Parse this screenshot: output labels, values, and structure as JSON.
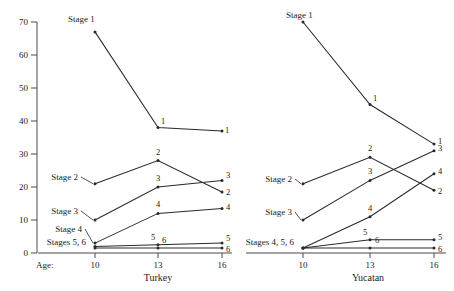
{
  "figure": {
    "axis": {
      "y_ticks": [
        0,
        10,
        20,
        30,
        40,
        50,
        60,
        70
      ],
      "y_min": 0,
      "y_max": 70,
      "x_ticks": [
        10,
        13,
        16
      ],
      "age_prefix_label": "Age:"
    },
    "panels": [
      {
        "title": "Turkey",
        "stage_labels": [
          "Stage 1",
          "Stage 2",
          "Stage 3",
          "Stage 4",
          "Stages 5, 6"
        ],
        "point_labels": [
          "1",
          "2",
          "3",
          "4",
          "5",
          "6"
        ]
      },
      {
        "title": "Yucatan",
        "stage_labels": [
          "Stage 1",
          "Stage 2",
          "Stage 3",
          "Stages 4, 5, 6"
        ],
        "point_labels": [
          "1",
          "2",
          "3",
          "4",
          "5",
          "6"
        ]
      }
    ]
  },
  "chart_data": {
    "type": "line",
    "title": "",
    "xlabel": "Age:",
    "ylabel": "",
    "x": [
      10,
      13,
      16
    ],
    "xlim": [
      10,
      16
    ],
    "ylim": [
      0,
      70
    ],
    "grid": false,
    "legend": "inline-labels",
    "panels": [
      {
        "name": "Turkey",
        "series": [
          {
            "name": "Stage 1",
            "label": "1",
            "values": [
              67,
              38,
              37
            ]
          },
          {
            "name": "Stage 2",
            "label": "2",
            "values": [
              21,
              28,
              18.5
            ]
          },
          {
            "name": "Stage 3",
            "label": "3",
            "values": [
              10,
              20,
              22
            ]
          },
          {
            "name": "Stage 4",
            "label": "4",
            "values": [
              3,
              12,
              13.5
            ]
          },
          {
            "name": "Stage 5",
            "label": "5",
            "values": [
              2,
              2.5,
              3
            ]
          },
          {
            "name": "Stage 6",
            "label": "6",
            "values": [
              1.5,
              1.5,
              1.5
            ]
          }
        ]
      },
      {
        "name": "Yucatan",
        "series": [
          {
            "name": "Stage 1",
            "label": "1",
            "values": [
              70,
              45,
              33
            ]
          },
          {
            "name": "Stage 2",
            "label": "2",
            "values": [
              21,
              29,
              19
            ]
          },
          {
            "name": "Stage 3",
            "label": "3",
            "values": [
              10,
              22,
              31
            ]
          },
          {
            "name": "Stage 4",
            "label": "4",
            "values": [
              1.5,
              11,
              24
            ]
          },
          {
            "name": "Stage 5",
            "label": "5",
            "values": [
              1.5,
              4,
              4
            ]
          },
          {
            "name": "Stage 6",
            "label": "6",
            "values": [
              1.5,
              1.5,
              1.5
            ]
          }
        ]
      }
    ]
  }
}
